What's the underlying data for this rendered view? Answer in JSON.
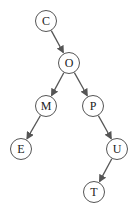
{
  "diagram": {
    "type": "binary-search-tree",
    "nodes": [
      {
        "id": "C",
        "label": "C",
        "x": 46,
        "y": 21
      },
      {
        "id": "O",
        "label": "O",
        "x": 69,
        "y": 63
      },
      {
        "id": "M",
        "label": "M",
        "x": 46,
        "y": 106
      },
      {
        "id": "P",
        "label": "P",
        "x": 93,
        "y": 106
      },
      {
        "id": "E",
        "label": "E",
        "x": 21,
        "y": 149
      },
      {
        "id": "U",
        "label": "U",
        "x": 117,
        "y": 149
      },
      {
        "id": "T",
        "label": "T",
        "x": 94,
        "y": 192
      }
    ],
    "edges": [
      {
        "from": "C",
        "to": "O"
      },
      {
        "from": "O",
        "to": "M"
      },
      {
        "from": "O",
        "to": "P"
      },
      {
        "from": "M",
        "to": "E"
      },
      {
        "from": "P",
        "to": "U"
      },
      {
        "from": "U",
        "to": "T"
      }
    ],
    "colors": {
      "stroke": "#555555",
      "text": "#222222",
      "background": "#ffffff"
    }
  }
}
